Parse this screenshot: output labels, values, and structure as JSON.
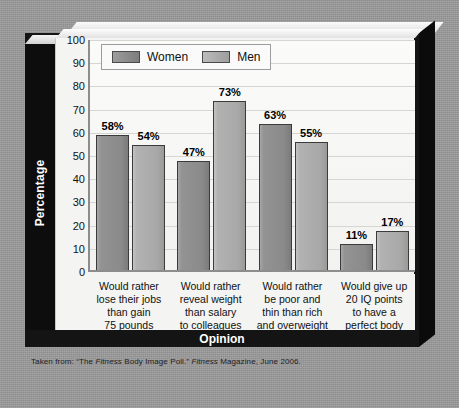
{
  "chart_data": {
    "type": "bar",
    "title": "",
    "xlabel": "Opinion",
    "ylabel": "Percentage",
    "ylim": [
      0,
      100
    ],
    "yticks": [
      100,
      90,
      80,
      70,
      60,
      50,
      40,
      30,
      20,
      10,
      0
    ],
    "grid": true,
    "legend_position": "top-left",
    "categories": [
      "Would rather lose their jobs than gain 75 pounds",
      "Would rather reveal weight than salary to colleagues",
      "Would rather be poor and thin than rich and overweight",
      "Would give up 20 IQ points to have a perfect body"
    ],
    "category_lines": [
      [
        "Would rather",
        "lose their jobs",
        "than gain",
        "75 pounds"
      ],
      [
        "Would rather",
        "reveal weight",
        "than salary",
        "to colleagues"
      ],
      [
        "Would rather",
        "be poor and",
        "thin than rich",
        "and overweight"
      ],
      [
        "Would give up",
        "20 IQ points",
        "to have a",
        "perfect body"
      ]
    ],
    "series": [
      {
        "name": "Women",
        "color": "#8b8b8b",
        "values": [
          58,
          54,
          47,
          11
        ],
        "labels": [
          "58%",
          "54%",
          "47%",
          "11%"
        ]
      },
      {
        "name": "Men",
        "color": "#ababab",
        "values": [
          54,
          73,
          55,
          17
        ],
        "labels": [
          "54%",
          "73%",
          "55%",
          "17%"
        ]
      }
    ],
    "bars_by_group": [
      [
        {
          "series": "Women",
          "value": 58,
          "label": "58%"
        },
        {
          "series": "Men",
          "value": 54,
          "label": "54%"
        }
      ],
      [
        {
          "series": "Women",
          "value": 47,
          "label": "47%"
        },
        {
          "series": "Men",
          "value": 73,
          "label": "73%"
        }
      ],
      [
        {
          "series": "Women",
          "value": 63,
          "label": "63%"
        },
        {
          "series": "Men",
          "value": 55,
          "label": "55%"
        }
      ],
      [
        {
          "series": "Women",
          "value": 11,
          "label": "11%"
        },
        {
          "series": "Men",
          "value": 17,
          "label": "17%"
        }
      ]
    ]
  },
  "legend": {
    "items": [
      {
        "label": "Women",
        "swatch_color": "#8b8b8b"
      },
      {
        "label": "Men",
        "swatch_color": "#ababab"
      }
    ]
  },
  "axes": {
    "y_title": "Percentage",
    "x_title": "Opinion",
    "y_ticks": [
      "100",
      "90",
      "80",
      "70",
      "60",
      "50",
      "40",
      "30",
      "20",
      "10",
      "0"
    ]
  },
  "source": {
    "prefix": "Taken from: “The ",
    "emphasis_1": "Fitness",
    "middle": " Body Image Poll.” ",
    "emphasis_2": "Fitness",
    "suffix": " Magazine, June 2006.",
    "full_text": "Taken from: “The Fitness Body Image Poll.” Fitness Magazine, June 2006."
  },
  "colors": {
    "board_background": "#9b9b9b",
    "plaque_dark": "#141414",
    "card_background": "#f4f4f2",
    "gridline": "#d5d5d3",
    "bar_outline": "#3b3b3b",
    "women_bar": "#8b8b8b",
    "men_bar": "#ababab"
  }
}
